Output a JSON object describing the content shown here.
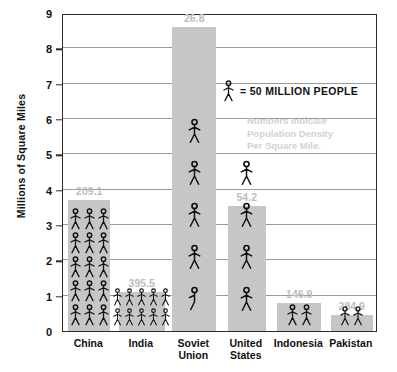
{
  "chart_data": {
    "type": "bar",
    "title": "",
    "xlabel": "",
    "ylabel": "Millions of Square Miles",
    "ylim": [
      0,
      9
    ],
    "yticks": [
      0,
      1,
      2,
      3,
      4,
      5,
      6,
      7,
      8,
      9
    ],
    "grid": true,
    "legend": {
      "symbol": "stick-figure",
      "text": "= 50 MILLION PEOPLE"
    },
    "annotation": [
      "Numbers Indicate",
      "Population Density",
      "Per Square Mile."
    ],
    "categories": [
      "China",
      "India",
      "Soviet Union",
      "United States",
      "Indonesia",
      "Pakistan"
    ],
    "values": [
      3.7,
      1.1,
      8.6,
      3.55,
      0.78,
      0.45
    ],
    "data_labels": [
      "209.1",
      "395.5",
      "26.8",
      "54.2",
      "146.9",
      "284.9"
    ],
    "data_label_meaning": "Population Density Per Square Mile",
    "pictograph_counts": [
      15,
      10,
      5,
      4,
      2,
      2
    ],
    "pictograph_columns": [
      3,
      5,
      1,
      1,
      2,
      2
    ],
    "pictograph_unit": "50 MILLION PEOPLE",
    "colors": {
      "bar": "#c6c6c6",
      "value_label": "#bdbdbd",
      "axis": "#2b2b2b",
      "gridline": "#9a9a9a",
      "note": "#d2d2d2",
      "text": "#111111",
      "background": "#ffffff"
    }
  }
}
